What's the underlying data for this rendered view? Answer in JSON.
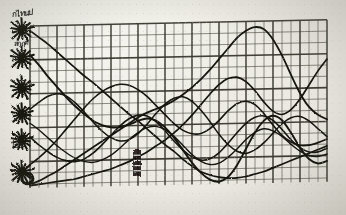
{
  "document": {
    "kind": "scanned-graph-paper-chart",
    "title": "",
    "background_color": "#efeee8",
    "ink_color": "#141310",
    "grid_color": "#3a372f"
  },
  "grid": {
    "left": 30,
    "top": 26,
    "right": 327,
    "bottom": 188,
    "minor_x_spacing": 9,
    "minor_y_spacing": 11.3,
    "major_every_x": 3,
    "major_every_y": 3,
    "skew_degrees": -1.2
  },
  "axis": {
    "orientation": "vertical-left",
    "marker_icon": "starburst-icon",
    "marker_count": 6,
    "markers": [
      {
        "label": "",
        "y": 30,
        "radius": 11
      },
      {
        "label": "",
        "y": 58,
        "radius": 11
      },
      {
        "label": "",
        "y": 88,
        "radius": 11
      },
      {
        "label": "",
        "y": 114,
        "radius": 10
      },
      {
        "label": "",
        "y": 140,
        "radius": 10
      },
      {
        "label": "",
        "y": 172,
        "radius": 11
      }
    ],
    "scrawled_labels": [
      {
        "text": "กไทนป",
        "x": 12,
        "y": 8,
        "size": 8,
        "rotate": -6
      },
      {
        "text": "สกฤต",
        "x": 14,
        "y": 38,
        "size": 7,
        "rotate": -4
      },
      {
        "text": "ไปปป",
        "x": 11,
        "y": 140,
        "size": 7,
        "rotate": -3
      }
    ]
  },
  "annotations": {
    "tower_marker": {
      "name": "vertical-bar-marker",
      "x": 133,
      "y": 150,
      "width": 8,
      "height": 26
    },
    "hook_mark": {
      "name": "hook-scrawl",
      "x": 26,
      "y": 182
    }
  },
  "chart_data": {
    "type": "line",
    "title": "",
    "xlabel": "",
    "ylabel": "",
    "grid": true,
    "legend": "none",
    "xlim": [
      0,
      33
    ],
    "ylim": [
      0,
      14
    ],
    "x": [
      0,
      1,
      2,
      3,
      4,
      5,
      6,
      7,
      8,
      9,
      10,
      11,
      12,
      13,
      14,
      15,
      16,
      17,
      18,
      19,
      20,
      21,
      22,
      23,
      24,
      25,
      26,
      27,
      28,
      29,
      30,
      31,
      32,
      33
    ],
    "series": [
      {
        "name": "series-1-descending-diagonal",
        "stroke": "#141310",
        "width": 1.7,
        "values": [
          13.6,
          13.0,
          12.4,
          11.7,
          11.0,
          10.3,
          9.6,
          9.0,
          8.3,
          7.6,
          6.9,
          6.2,
          5.6,
          4.9,
          4.2,
          3.5,
          2.9,
          2.2,
          1.6,
          1.1,
          0.8,
          0.6,
          0.5,
          0.5,
          0.6,
          0.8,
          1.0,
          1.3,
          1.6,
          1.9,
          2.2,
          2.5,
          2.8,
          3.1
        ]
      },
      {
        "name": "series-2-rising-peak-right",
        "stroke": "#141310",
        "width": 1.8,
        "values": [
          0.3,
          0.6,
          1.0,
          1.4,
          1.9,
          2.4,
          2.9,
          3.4,
          3.9,
          4.4,
          4.9,
          5.4,
          5.9,
          6.3,
          6.6,
          6.9,
          7.3,
          7.8,
          8.4,
          9.1,
          9.9,
          10.8,
          11.7,
          12.6,
          13.2,
          13.5,
          13.3,
          12.4,
          11.0,
          9.3,
          7.7,
          6.5,
          5.8,
          5.4
        ]
      },
      {
        "name": "series-3-broad-hump",
        "stroke": "#141310",
        "width": 1.6,
        "values": [
          2.0,
          2.6,
          3.3,
          4.1,
          5.0,
          5.9,
          6.8,
          7.6,
          8.2,
          8.6,
          8.8,
          8.7,
          8.3,
          7.7,
          6.9,
          6.1,
          5.3,
          4.7,
          4.4,
          4.4,
          4.8,
          5.5,
          6.3,
          6.9,
          7.1,
          6.8,
          6.0,
          5.0,
          4.1,
          3.5,
          3.2,
          3.2,
          3.4,
          3.7
        ]
      },
      {
        "name": "series-4-zigzag-low",
        "stroke": "#141310",
        "width": 1.6,
        "values": [
          4.4,
          3.7,
          3.1,
          2.6,
          2.3,
          2.2,
          2.4,
          2.9,
          3.6,
          4.4,
          5.2,
          5.8,
          6.1,
          6.0,
          5.5,
          4.7,
          3.8,
          3.0,
          2.4,
          2.1,
          2.2,
          2.7,
          3.5,
          4.4,
          5.2,
          5.7,
          5.8,
          5.4,
          4.6,
          3.7,
          3.0,
          2.6,
          2.6,
          2.9
        ]
      },
      {
        "name": "series-5-deep-v",
        "stroke": "#141310",
        "width": 1.9,
        "values": [
          11.5,
          10.6,
          9.6,
          8.7,
          7.8,
          7.0,
          6.3,
          5.7,
          5.3,
          5.1,
          5.1,
          5.3,
          5.6,
          5.8,
          5.6,
          5.0,
          4.1,
          3.0,
          1.9,
          1.0,
          0.4,
          0.2,
          0.6,
          1.6,
          3.0,
          4.4,
          5.4,
          5.8,
          5.4,
          4.3,
          3.0,
          2.0,
          1.6,
          1.8
        ]
      },
      {
        "name": "series-6-sawtooth",
        "stroke": "#141310",
        "width": 1.5,
        "values": [
          6.8,
          7.4,
          7.9,
          8.1,
          7.9,
          7.3,
          6.5,
          5.6,
          4.8,
          4.2,
          3.9,
          4.0,
          4.5,
          5.3,
          6.2,
          7.0,
          7.5,
          7.6,
          7.2,
          6.4,
          5.4,
          4.3,
          3.4,
          2.8,
          2.6,
          2.9,
          3.5,
          4.3,
          5.1,
          5.6,
          5.7,
          5.3,
          4.6,
          3.9
        ]
      },
      {
        "name": "series-7-steep-riser",
        "stroke": "#141310",
        "width": 1.7,
        "values": [
          0.2,
          0.3,
          0.4,
          0.5,
          0.6,
          0.7,
          0.9,
          1.1,
          1.3,
          1.5,
          1.8,
          2.1,
          2.5,
          2.9,
          3.4,
          3.9,
          4.5,
          5.2,
          6.0,
          6.9,
          7.8,
          8.6,
          9.1,
          9.2,
          8.8,
          8.0,
          7.0,
          6.2,
          5.9,
          6.3,
          7.2,
          8.4,
          9.6,
          10.6
        ]
      },
      {
        "name": "series-8-low-undulating",
        "stroke": "#141310",
        "width": 1.4,
        "values": [
          5.6,
          5.0,
          4.3,
          3.6,
          3.0,
          2.5,
          2.2,
          2.1,
          2.3,
          2.7,
          3.3,
          4.0,
          4.6,
          5.0,
          5.1,
          4.8,
          4.2,
          3.4,
          2.6,
          2.0,
          1.7,
          1.8,
          2.3,
          3.0,
          3.8,
          4.4,
          4.7,
          4.5,
          4.0,
          3.3,
          2.7,
          2.3,
          2.2,
          2.4
        ]
      }
    ]
  }
}
